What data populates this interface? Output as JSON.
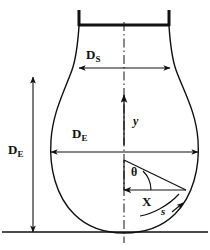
{
  "figure": {
    "background_color": "#ffffff",
    "line_color": "#111111",
    "width": 210,
    "height": 250
  },
  "labels": {
    "neck_diameter": {
      "symbol": "D",
      "subscript": "S",
      "name": "D_S"
    },
    "equatorial_diameter_horizontal": {
      "symbol": "D",
      "subscript": "E",
      "name": "D_E"
    },
    "equatorial_diameter_vertical": {
      "symbol": "D",
      "subscript": "E",
      "name": "D_E"
    },
    "vertical_axis": {
      "symbol": "y"
    },
    "horizontal_radius": {
      "symbol": "X"
    },
    "angle": {
      "symbol": "θ"
    },
    "arc_length": {
      "symbol": "s"
    }
  },
  "geometry": {
    "centerline_x": 124,
    "baseline_y": 232,
    "rim_top_y": 10,
    "rim_bar_y": 25,
    "rim_left_x": 78,
    "rim_right_x": 170,
    "neck_dimension_y": 68,
    "neck_left_x": 79,
    "neck_right_x": 170,
    "equator_dimension_y": 152,
    "equator_left_x": 51,
    "equator_right_x": 198,
    "vertical_dimension_x": 33,
    "vertical_dimension_top_y": 77,
    "vertical_dimension_bottom_y": 232,
    "y_arrow_x": 124,
    "y_arrow_bottom_y": 145,
    "y_arrow_top_y": 95,
    "triangle_apex_x": 124,
    "triangle_apex_y": 160,
    "triangle_corner_x": 124,
    "triangle_corner_y": 190,
    "triangle_right_x": 185,
    "triangle_right_y": 190
  }
}
